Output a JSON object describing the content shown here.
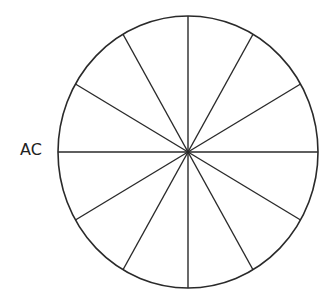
{
  "diagram": {
    "type": "divided-circle",
    "sectors": 12,
    "sector_angle_deg": 30,
    "label": "AC",
    "center": [
      188,
      152
    ],
    "rx": 130,
    "ry": 136,
    "stroke_color": "#2a2a2a",
    "background": "#ffffff"
  }
}
